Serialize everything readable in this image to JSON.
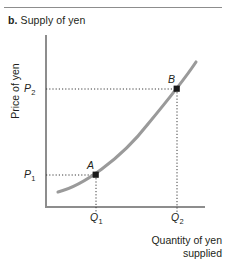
{
  "figure": {
    "panel_letter": "b.",
    "panel_title": "Supply of yen",
    "rule_color": "#8d8d8d"
  },
  "chart_data": {
    "type": "line",
    "title": "b. Supply of yen",
    "xlabel": "Quantity of yen supplied",
    "xlabel_line1": "Quantity of yen",
    "xlabel_line2": "supplied",
    "ylabel": "Price of yen",
    "grid": false,
    "legend": null,
    "curve_name": "Supply of yen",
    "curve_color": "#9a9a9a",
    "axis_color": "#8d8d8d",
    "marker_color": "#1a1a1a",
    "guide_color": "#3a3a3a",
    "xlim": [
      0,
      1
    ],
    "ylim": [
      0,
      1
    ],
    "xticks": [
      "Q1",
      "Q2"
    ],
    "yticks": [
      "P1",
      "P2"
    ],
    "x_tick_labels": [
      {
        "base": "Q",
        "sub": "1"
      },
      {
        "base": "Q",
        "sub": "2"
      }
    ],
    "y_tick_labels": [
      {
        "base": "P",
        "sub": "1"
      },
      {
        "base": "P",
        "sub": "2"
      }
    ],
    "points": [
      {
        "label": "A",
        "x": 0.315,
        "y": 0.186,
        "px": 96,
        "py": 175
      },
      {
        "label": "B",
        "x": 0.824,
        "y": 0.686,
        "px": 177,
        "py": 89
      }
    ],
    "curve_path": "M 58 192 C 82 186, 120 160, 148 124 C 172 95, 188 74, 196 62",
    "annotations": [
      "Upward-sloping convex supply curve",
      "Dotted guide lines from P1 to A and A down to Q1",
      "Dotted guide lines from P2 to B and B down to Q2"
    ]
  }
}
